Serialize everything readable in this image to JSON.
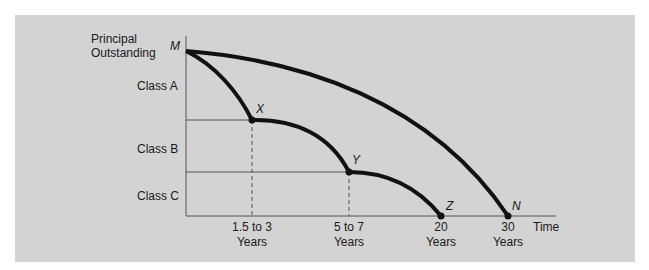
{
  "diagram": {
    "y_axis_label": [
      "Principal",
      "Outstanding"
    ],
    "x_axis_label": "Time",
    "classes": [
      {
        "label": "Class A"
      },
      {
        "label": "Class B"
      },
      {
        "label": "Class C"
      }
    ],
    "points": {
      "M": "M",
      "X": "X",
      "Y": "Y",
      "Z": "Z",
      "N": "N"
    },
    "x_ticks": [
      {
        "line1": "1.5 to 3",
        "line2": "Years"
      },
      {
        "line1": "5 to 7",
        "line2": "Years"
      },
      {
        "line1": "20",
        "line2": "Years"
      },
      {
        "line1": "30",
        "line2": "Years"
      }
    ],
    "colors": {
      "panel": "#d3d3d3",
      "curve": "#111111",
      "axis": "#555555"
    }
  }
}
